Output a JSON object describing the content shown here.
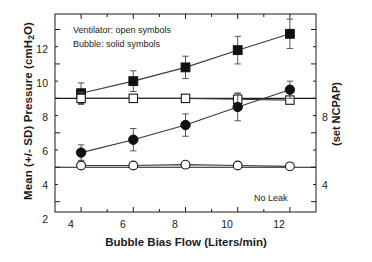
{
  "chart_data": {
    "type": "line",
    "title": "",
    "xlabel": "Bubble Bias Flow (Liters/min)",
    "ylabel": "Mean (+/- SD) Pressure (cmH2O)",
    "ylabel_parts": {
      "pre": "Mean (+/- SD) Pressure (cmH",
      "sub": "2",
      "post": "O)"
    },
    "y2label": "(set NCPAP)",
    "x": [
      4,
      6,
      8,
      10,
      12
    ],
    "xlim": [
      3,
      13
    ],
    "ylim": [
      1.4,
      12.9
    ],
    "xticks": [
      4,
      6,
      8,
      10,
      12
    ],
    "xticklabels": [
      "4",
      "6",
      "8",
      "10",
      "12"
    ],
    "yticks": [
      2,
      3,
      4,
      5,
      6,
      7,
      8,
      9,
      10,
      11,
      12
    ],
    "ytick_major": [
      2,
      4,
      6,
      8,
      10,
      12
    ],
    "yticklabels": [
      "12",
      "10",
      "8",
      "6",
      "4",
      "2"
    ],
    "y2ticks_labeled": [
      8,
      4
    ],
    "y2ticklabels": [
      "8",
      "4"
    ],
    "grid": false,
    "legend_position": "upper-left-inside",
    "series": [
      {
        "name": "Bubble (set NCPAP 8)",
        "marker": "filled-square",
        "values": [
          8.3,
          9.0,
          9.8,
          10.8,
          11.75
        ],
        "errors": [
          0.6,
          0.6,
          0.65,
          0.8,
          0.85
        ]
      },
      {
        "name": "Ventilator (set NCPAP 8)",
        "marker": "open-square",
        "values": [
          8.0,
          8.0,
          8.0,
          7.95,
          7.9
        ],
        "errors": [
          0.35,
          0.15,
          0.2,
          0.35,
          0.12
        ]
      },
      {
        "name": "Bubble (set NCPAP 4)",
        "marker": "filled-circle",
        "values": [
          4.85,
          5.6,
          6.45,
          7.5,
          8.5
        ],
        "errors": [
          0.45,
          0.65,
          0.65,
          0.8,
          0.5
        ]
      },
      {
        "name": "Ventilator (set NCPAP 4)",
        "marker": "open-circle",
        "values": [
          4.1,
          4.1,
          4.15,
          4.1,
          4.05
        ],
        "errors": [
          0.12,
          0.1,
          0.1,
          0.1,
          0.1
        ]
      }
    ],
    "reference_lines": [
      8,
      4
    ],
    "annotations": [
      {
        "name": "legend-line-1",
        "text": "Ventilator: open symbols"
      },
      {
        "name": "legend-line-2",
        "text": "Bubble: solid symbols"
      },
      {
        "name": "no-leak-note",
        "text": "No Leak"
      }
    ],
    "colors": {
      "axis": "#1a1a1a",
      "marker_fill": "#111111",
      "marker_open": "#ffffff",
      "line": "#3a3a3a"
    }
  },
  "legend": {
    "ventilator": "Ventilator: open symbols",
    "bubble": "Bubble: solid symbols"
  },
  "notes": {
    "no_leak": "No Leak"
  }
}
